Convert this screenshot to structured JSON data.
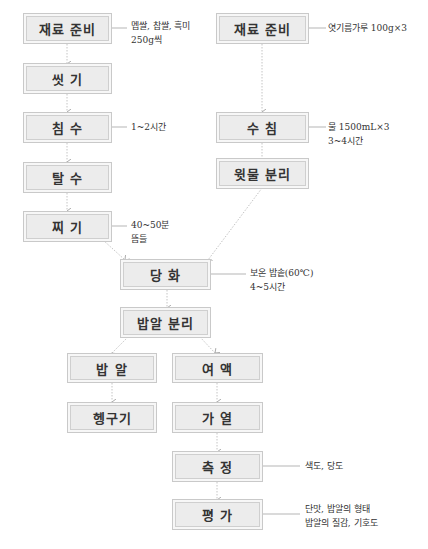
{
  "colors": {
    "box_fill": "#ececec",
    "box_border": "#c9c9c9",
    "arrow": "#bbbbbb",
    "text": "#333333"
  },
  "left_flow": {
    "steps": [
      {
        "label": "재료 준비",
        "note": [
          "멥쌀, 찹쌀, 흑미",
          "250g씩"
        ]
      },
      {
        "label": "씻 기"
      },
      {
        "label": "침 수",
        "note": [
          "1~2시간"
        ]
      },
      {
        "label": "탈 수"
      },
      {
        "label": "찌 기",
        "note": [
          "40~50분",
          "뜸들"
        ]
      }
    ]
  },
  "right_flow": {
    "steps": [
      {
        "label": "재료 준비",
        "note": [
          "엿기름가루 100g×3"
        ]
      },
      {
        "label": "수 침",
        "note": [
          "물 1500mL×3",
          "3~4시간"
        ]
      },
      {
        "label": "윗물 분리"
      }
    ]
  },
  "merge_flow": {
    "steps": [
      {
        "label": "당 화",
        "note": [
          "보온 밥솥(60℃)",
          "4~5시간"
        ]
      },
      {
        "label": "밥알 분리"
      }
    ]
  },
  "branch_rice": {
    "steps": [
      {
        "label": "밥 알"
      },
      {
        "label": "헹구기"
      }
    ]
  },
  "branch_liquid": {
    "steps": [
      {
        "label": "여 액"
      },
      {
        "label": "가 열"
      },
      {
        "label": "측 정",
        "note": [
          "색도, 당도"
        ]
      },
      {
        "label": "평 가",
        "note": [
          "단맛, 밥알의 형태",
          "밥알의 질감, 기호도"
        ]
      }
    ]
  }
}
